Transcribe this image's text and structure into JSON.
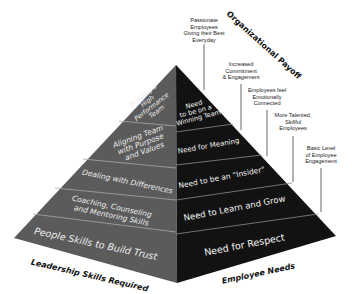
{
  "diagram": {
    "type": "pyramid",
    "left_caption": "Leadership Skills Required",
    "right_caption": "Employee Needs",
    "side_caption": "Organizational Payoff",
    "colors": {
      "left_face": "#5b5b5b",
      "right_face": "#111111",
      "divider": "#9a9a9a",
      "annotation_line": "#555555"
    },
    "left_tiers": [
      {
        "lines": [
          "Building a",
          "High",
          "Performance",
          "Team"
        ]
      },
      {
        "lines": [
          "Aligning Team",
          "with Purpose",
          "and Values"
        ]
      },
      {
        "lines": [
          "Dealing with Differences"
        ]
      },
      {
        "lines": [
          "Coaching, Counseling",
          "and Mentoring Skills"
        ]
      },
      {
        "lines": [
          "People Skills to Build Trust"
        ]
      }
    ],
    "right_tiers": [
      {
        "lines": [
          "Need",
          "to be on a",
          "Winning Team"
        ]
      },
      {
        "lines": [
          "Need for Meaning"
        ]
      },
      {
        "lines": [
          "Need to be an \"Insider\""
        ]
      },
      {
        "lines": [
          "Need to Learn and Grow"
        ]
      },
      {
        "lines": [
          "Need for Respect"
        ]
      }
    ],
    "payoffs": [
      {
        "lines": [
          "Passionate",
          "Employees",
          "Giving their Best",
          "Everyday"
        ]
      },
      {
        "lines": [
          "Increased",
          "Commitment",
          "& Engagement"
        ]
      },
      {
        "lines": [
          "Employees feel",
          "Emotionally",
          "Connected"
        ]
      },
      {
        "lines": [
          "More Talented,",
          "Skillful",
          "Employees"
        ]
      },
      {
        "lines": [
          "Basic Level",
          "of Employee",
          "Engagement"
        ]
      }
    ]
  }
}
